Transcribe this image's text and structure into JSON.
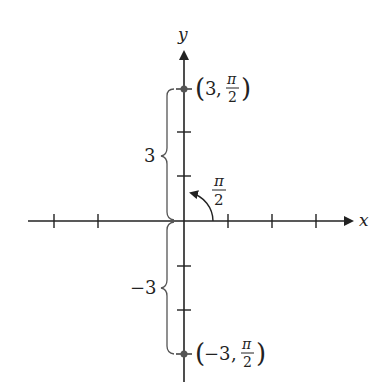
{
  "diagram": {
    "type": "polar-point-representation",
    "axes": {
      "x_label": "x",
      "y_label": "y"
    },
    "points": [
      {
        "label_r": "3",
        "label_theta_num": "π",
        "label_theta_den": "2",
        "r": 3,
        "theta": "π/2"
      },
      {
        "label_r": "−3",
        "label_theta_num": "π",
        "label_theta_den": "2",
        "r": -3,
        "theta": "π/2"
      }
    ],
    "braces": [
      {
        "label": "3"
      },
      {
        "label": "−3"
      }
    ],
    "angle": {
      "num": "π",
      "den": "2"
    },
    "colors": {
      "stroke": "#222222",
      "brace": "#555555"
    }
  }
}
